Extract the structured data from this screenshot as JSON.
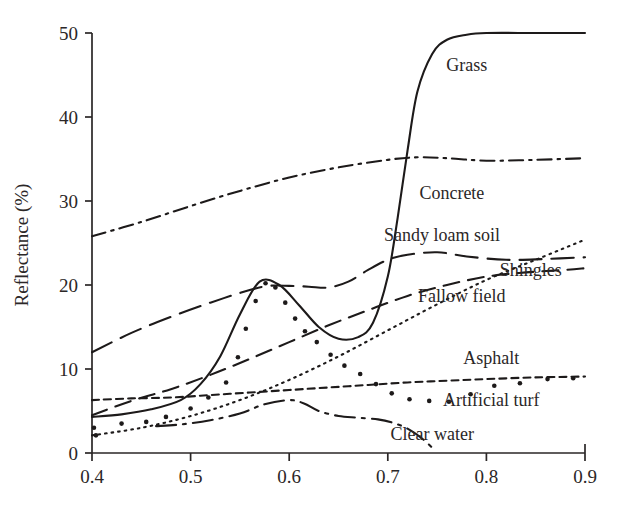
{
  "chart_data": {
    "type": "line",
    "title": "",
    "xlabel": "",
    "ylabel": "Reflectance (%)",
    "xlim": [
      0.4,
      0.9
    ],
    "ylim": [
      0,
      50
    ],
    "xticks": [
      "0.4",
      "0.5",
      "0.6",
      "0.7",
      "0.8",
      "0.9"
    ],
    "xtick_values": [
      0.4,
      0.5,
      0.6,
      0.7,
      0.8,
      0.9
    ],
    "yticks": [
      "0",
      "10",
      "20",
      "30",
      "40",
      "50"
    ],
    "ytick_values": [
      0,
      10,
      20,
      30,
      40,
      50
    ],
    "grid": false,
    "legend_position": "inline-right-annotations",
    "series": [
      {
        "name": "Grass",
        "label": "Grass",
        "style": "solid",
        "x": [
          0.4,
          0.43,
          0.46,
          0.49,
          0.51,
          0.53,
          0.55,
          0.57,
          0.59,
          0.61,
          0.63,
          0.65,
          0.67,
          0.685,
          0.7,
          0.71,
          0.72,
          0.73,
          0.745,
          0.76,
          0.78,
          0.8,
          0.85,
          0.9
        ],
        "y": [
          4.3,
          4.6,
          5.2,
          6.3,
          8.2,
          11.5,
          16.5,
          20.4,
          20.0,
          17.6,
          15.0,
          13.6,
          13.8,
          15.5,
          21.0,
          28.0,
          36.0,
          43.0,
          47.5,
          49.2,
          49.8,
          50.0,
          50.0,
          50.0
        ]
      },
      {
        "name": "Concrete",
        "label": "Concrete",
        "style": "dash-dot",
        "x": [
          0.4,
          0.45,
          0.5,
          0.55,
          0.6,
          0.65,
          0.7,
          0.73,
          0.76,
          0.8,
          0.85,
          0.9
        ],
        "y": [
          25.8,
          27.5,
          29.4,
          31.2,
          32.8,
          34.0,
          34.9,
          35.2,
          35.1,
          34.8,
          34.9,
          35.1
        ]
      },
      {
        "name": "Sandy loam soil",
        "label": "Sandy loam soil",
        "style": "long-dash",
        "x": [
          0.4,
          0.44,
          0.48,
          0.52,
          0.56,
          0.58,
          0.6,
          0.62,
          0.64,
          0.66,
          0.68,
          0.7,
          0.72,
          0.75,
          0.78,
          0.82,
          0.86,
          0.9
        ],
        "y": [
          12.0,
          14.3,
          16.2,
          17.9,
          19.4,
          19.9,
          19.9,
          19.8,
          19.7,
          20.4,
          21.8,
          23.0,
          23.6,
          23.9,
          23.4,
          23.0,
          23.1,
          23.3
        ]
      },
      {
        "name": "Shingles",
        "label": "Shingles",
        "style": "dotted-fine",
        "x": [
          0.4,
          0.45,
          0.5,
          0.55,
          0.6,
          0.65,
          0.7,
          0.75,
          0.8,
          0.85,
          0.9
        ],
        "y": [
          2.1,
          3.0,
          4.4,
          6.3,
          8.7,
          11.5,
          14.6,
          17.7,
          20.6,
          23.0,
          25.4
        ]
      },
      {
        "name": "Fallow field",
        "label": "Fallow field",
        "style": "dashed",
        "x": [
          0.4,
          0.44,
          0.48,
          0.52,
          0.56,
          0.6,
          0.64,
          0.68,
          0.72,
          0.76,
          0.8,
          0.84,
          0.88,
          0.9
        ],
        "y": [
          4.5,
          6.2,
          7.6,
          9.3,
          11.2,
          13.2,
          15.2,
          17.0,
          18.7,
          20.0,
          21.0,
          21.5,
          21.8,
          22.0
        ]
      },
      {
        "name": "Artificial turf",
        "label": "Artificial turf",
        "style": "short-dash",
        "x": [
          0.4,
          0.44,
          0.48,
          0.52,
          0.56,
          0.6,
          0.64,
          0.68,
          0.72,
          0.76,
          0.8,
          0.85,
          0.9
        ],
        "y": [
          6.3,
          6.5,
          6.6,
          6.9,
          7.2,
          7.5,
          7.8,
          8.1,
          8.4,
          8.6,
          8.8,
          9.0,
          9.1
        ]
      },
      {
        "name": "Asphalt",
        "label": "Asphalt",
        "style": "scatter-dots",
        "x": [
          0.402,
          0.404,
          0.43,
          0.455,
          0.475,
          0.5,
          0.518,
          0.536,
          0.548,
          0.556,
          0.566,
          0.576,
          0.586,
          0.596,
          0.606,
          0.616,
          0.628,
          0.642,
          0.656,
          0.672,
          0.688,
          0.704,
          0.722,
          0.742,
          0.762,
          0.784,
          0.808,
          0.834,
          0.862,
          0.888
        ],
        "y": [
          3.0,
          2.1,
          3.5,
          3.7,
          4.3,
          5.3,
          6.6,
          8.4,
          11.4,
          14.8,
          18.1,
          20.2,
          19.7,
          17.9,
          16.0,
          14.5,
          13.2,
          11.7,
          10.4,
          9.4,
          8.2,
          7.1,
          6.4,
          6.2,
          6.1,
          7.0,
          8.0,
          8.3,
          8.8,
          8.9
        ]
      },
      {
        "name": "Clear water",
        "label": "Clear water",
        "style": "dash-dot-long",
        "x": [
          0.465,
          0.49,
          0.52,
          0.55,
          0.575,
          0.6,
          0.615,
          0.63,
          0.65,
          0.67,
          0.69,
          0.705,
          0.72,
          0.735,
          0.748
        ],
        "y": [
          3.2,
          3.4,
          3.9,
          4.7,
          5.8,
          6.3,
          5.9,
          5.0,
          4.4,
          4.2,
          4.0,
          3.6,
          2.9,
          1.7,
          0.3
        ]
      }
    ],
    "annotations": [
      {
        "text": "Grass",
        "x": 0.78,
        "y": 46.2
      },
      {
        "text": "Concrete",
        "x": 0.765,
        "y": 30.9
      },
      {
        "text": "Sandy loam soil",
        "x": 0.755,
        "y": 26.0
      },
      {
        "text": "Shingles",
        "x": 0.845,
        "y": 21.8
      },
      {
        "text": "Fallow field",
        "x": 0.775,
        "y": 18.7
      },
      {
        "text": "Asphalt",
        "x": 0.805,
        "y": 11.3
      },
      {
        "text": "Artificial turf",
        "x": 0.805,
        "y": 6.3
      },
      {
        "text": "Clear water",
        "x": 0.745,
        "y": 2.3
      }
    ]
  },
  "axes": {
    "y_title": "Reflectance (%)",
    "x_tick_labels": [
      "0.4",
      "0.5",
      "0.6",
      "0.7",
      "0.8",
      "0.9"
    ],
    "y_tick_labels": [
      "0",
      "10",
      "20",
      "30",
      "40",
      "50"
    ]
  }
}
